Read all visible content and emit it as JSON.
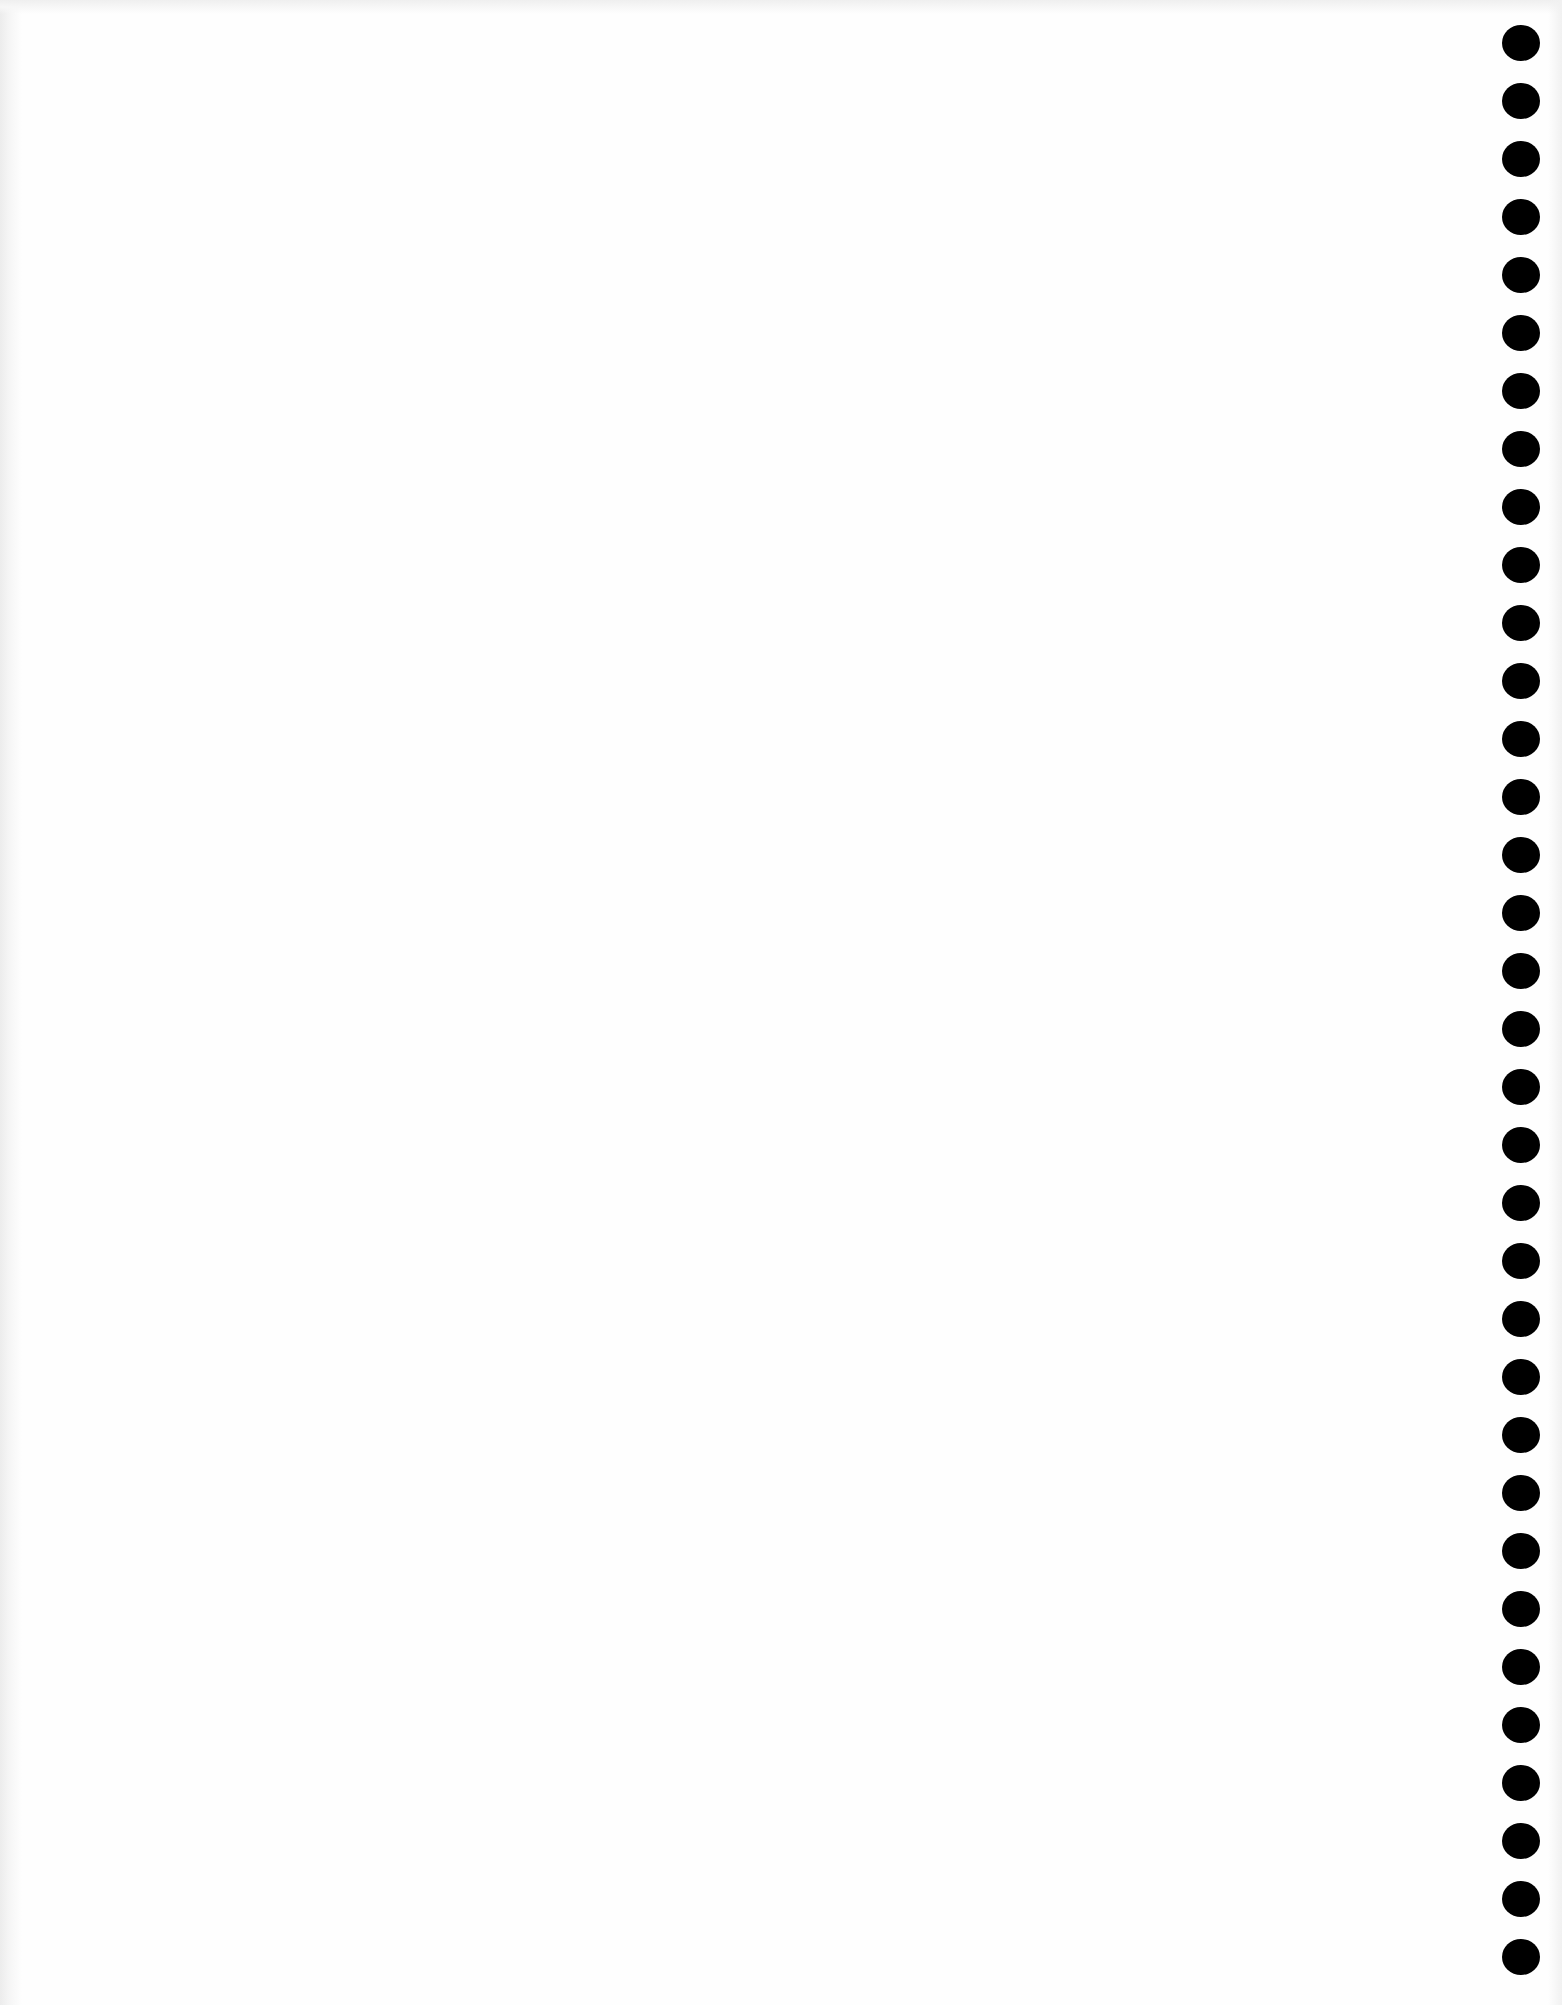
{
  "document": {
    "type": "blank scanned page",
    "background_color": "#fefefe",
    "text_content": ""
  },
  "punch_holes": {
    "count": 34,
    "color": "#000000",
    "side": "right",
    "center_x": 1520,
    "first_center_y": 43,
    "last_center_y": 1957,
    "diameter": 37
  }
}
